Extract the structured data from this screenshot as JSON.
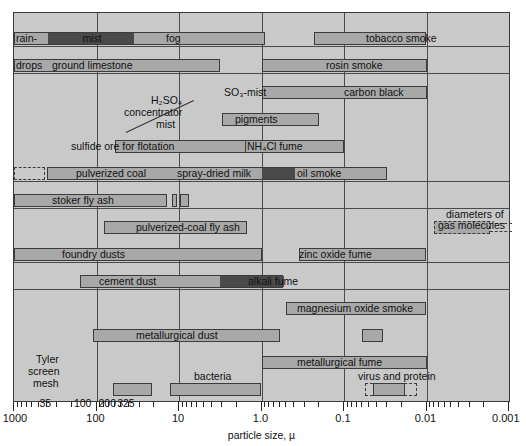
{
  "chart_data": {
    "type": "bar",
    "title": "",
    "xlabel": "particle size, µ",
    "ylabel": "",
    "scale": "log-reverse",
    "xlim": [
      1000,
      0.001
    ],
    "xticks": [
      "1000",
      "100",
      "10",
      "1.0",
      "0.1",
      "0.01",
      "0.001"
    ],
    "grid": true,
    "legend": "none",
    "secondary_axis": {
      "name": "Tyler screen mesh",
      "label_lines": [
        "Tyler",
        "screen",
        "mesh"
      ],
      "ticks": [
        "35",
        "100",
        "200",
        "325"
      ],
      "values": [
        417,
        147,
        74,
        44
      ]
    },
    "items": [
      {
        "label": "rain-",
        "from": 1000,
        "to": 0.9,
        "dark_from": 400,
        "dark_to": 36,
        "row": 0,
        "label_x": 16,
        "label_align": "left"
      },
      {
        "label": "mist",
        "from": null,
        "to": null,
        "row": 0,
        "label_x": 78,
        "label_align": "center",
        "note": "same bar as rain"
      },
      {
        "label": "fog",
        "from": null,
        "to": null,
        "row": 0,
        "label_x": 152,
        "label_align": "left"
      },
      {
        "label": "tobacco smoke",
        "from": 0.23,
        "to": 0.01,
        "row": 0,
        "label_x": 411,
        "label_align": "center"
      },
      {
        "label": "drops",
        "from": null,
        "to": null,
        "row": 1,
        "label_x": 16,
        "label_align": "left"
      },
      {
        "label": "ground limestone",
        "from": 1000,
        "to": 3.2,
        "row": 1,
        "label_x": 46,
        "label_align": "left"
      },
      {
        "label": "rosin smoke",
        "from": 1.0,
        "to": 0.01,
        "row": 1,
        "label_x": 328,
        "label_align": "left"
      },
      {
        "label": "H₂SO₄",
        "row": 1,
        "note": "leader-label"
      },
      {
        "label": "SO₃-mist",
        "from": 0.6,
        "to": 0.1,
        "row": 2,
        "label_x": 248,
        "label_align": "left"
      },
      {
        "label": "carbon black",
        "from": 1.0,
        "to": 0.01,
        "row": 2,
        "label_x": 344,
        "label_align": "left"
      },
      {
        "label": "concentrator",
        "row": 2,
        "note": "leader-label"
      },
      {
        "label": "pigments",
        "from": 3.0,
        "to": 0.2,
        "row": 3,
        "label_x": 238,
        "label_align": "left"
      },
      {
        "label": "mist",
        "row": 3,
        "note": "leader-label"
      },
      {
        "label": "sulfide ore for flotation",
        "from": 60,
        "to": 1.0,
        "row": 4,
        "label_x": 76,
        "label_align": "left"
      },
      {
        "label": "NH₄Cl fume",
        "from": 1.6,
        "to": 0.1,
        "row": 4,
        "label_x": 248,
        "label_align": "left"
      },
      {
        "label": "pulverized coal",
        "from": 400,
        "to": 1.0,
        "row": 5,
        "label_x": 75,
        "label_align": "left"
      },
      {
        "label": "spray-dried milk",
        "from": 1.0,
        "to": 0.4,
        "row": 5,
        "label_x": 176,
        "label_align": "left"
      },
      {
        "label": "oil smoke",
        "from": 0.4,
        "to": 0.03,
        "row": 5,
        "label_x": 296,
        "label_align": "left"
      },
      {
        "label": "stoker fly ash",
        "from": 1000,
        "to": 12,
        "row": 6,
        "label_x": 50,
        "label_align": "left"
      },
      {
        "label": "pulverized-coal fly ash",
        "from": 80,
        "to": 1.5,
        "row": 7,
        "label_x": 135,
        "label_align": "left"
      },
      {
        "label": "foundry dusts",
        "from": 1000,
        "to": 1.0,
        "row": 8,
        "label_x": 60,
        "label_align": "left"
      },
      {
        "label": "zinc oxide fume",
        "from": 0.35,
        "to": 0.01,
        "row": 8,
        "label_x": 298,
        "label_align": "left"
      },
      {
        "label": "cement dust",
        "from": 160,
        "to": 0.8,
        "dark_from": 3.5,
        "dark_to": 0.8,
        "row": 9,
        "label_x": 98,
        "label_align": "left"
      },
      {
        "label": "alkali fume",
        "from": null,
        "to": null,
        "row": 9,
        "label_x": 247,
        "label_align": "left"
      },
      {
        "label": "magnesium oxide smoke",
        "from": 0.5,
        "to": 0.01,
        "row": 10,
        "label_x": 296,
        "label_align": "left"
      },
      {
        "label": "metallurgical dust",
        "from": 110,
        "to": 0.6,
        "row": 11,
        "label_x": 135,
        "label_align": "left"
      },
      {
        "label": "metallurgical fume",
        "from": 1.0,
        "to": 0.01,
        "row": 12,
        "label_x": 296,
        "label_align": "left"
      },
      {
        "label": "bacteria",
        "from": 10,
        "to": 1.0,
        "row": 13,
        "label_x": 192,
        "label_align": "left"
      },
      {
        "label": "virus and protein",
        "from": 0.05,
        "to": 0.015,
        "row": 13,
        "label_x": 356,
        "label_align": "left"
      },
      {
        "label": "diameters of gas molecules",
        "from": 0.008,
        "to": 0.0018,
        "row": 7,
        "label_x": 440,
        "label_align": "left"
      }
    ]
  },
  "labels": {
    "rain": "rain-",
    "drops": "drops",
    "mist": "mist",
    "fog": "fog",
    "tobacco_smoke": "tobacco smoke",
    "ground_limestone": "ground limestone",
    "rosin_smoke": "rosin smoke",
    "h2so4_l1": "H₂SO₄",
    "h2so4_l2": "concentrator",
    "h2so4_l3": "mist",
    "so3_mist": "SO₃-mist",
    "carbon_black": "carbon black",
    "pigments": "pigments",
    "sulfide_ore": "sulfide ore for flotation",
    "nh4cl_fume": "NH₄Cl fume",
    "pulverized_coal": "pulverized coal",
    "spray_dried_milk": "spray-dried milk",
    "oil_smoke": "oil smoke",
    "stoker_fly_ash": "stoker fly ash",
    "pulverized_coal_fly_ash": "pulverized-coal fly ash",
    "foundry_dusts": "foundry dusts",
    "zinc_oxide_fume": "zinc oxide fume",
    "cement_dust": "cement dust",
    "alkali_fume": "alkali fume",
    "magnesium_oxide_smoke": "magnesium oxide smoke",
    "metallurgical_dust": "metallurgical dust",
    "metallurgical_fume": "metallurgical fume",
    "bacteria": "bacteria",
    "virus_and_protein": "virus and protein",
    "gas_mol_l1": "diameters of",
    "gas_mol_l2": "gas molecules",
    "tyler_l1": "Tyler",
    "tyler_l2": "screen",
    "tyler_l3": "mesh"
  },
  "axis": {
    "title": "particle size, µ",
    "ticks": [
      "1000",
      "100",
      "10",
      "1.0",
      "0.1",
      "0.01",
      "0.001"
    ],
    "mesh_ticks": [
      "35",
      "100",
      "200",
      "325"
    ]
  },
  "colors": {
    "plot_background": "#c9c9c9",
    "bar_fill": "#a8a8a8",
    "bar_dark": "#4a4a4a",
    "outline": "#3c3c3c",
    "text": "#111111"
  }
}
